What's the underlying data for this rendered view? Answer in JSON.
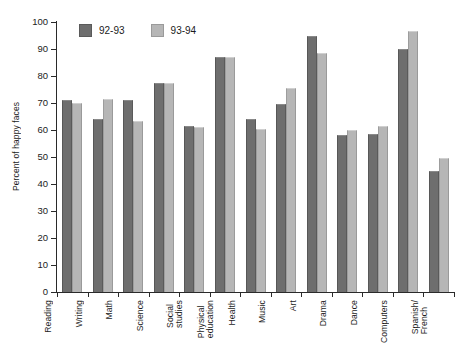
{
  "chart_data": {
    "type": "bar",
    "title": "",
    "xlabel": "",
    "ylabel": "Percent of happy faces",
    "ylim": [
      0,
      100
    ],
    "yticks": [
      0,
      10,
      20,
      30,
      40,
      50,
      60,
      70,
      80,
      90,
      100
    ],
    "grid": false,
    "legend_position": "top-left-inside",
    "categories": [
      "Reading",
      "Writing",
      "Math",
      "Science",
      "Social\nstudies",
      "Physical\neducation",
      "Health",
      "Music",
      "Art",
      "Drama",
      "Dance",
      "Computers",
      "Spanish/\nFrench"
    ],
    "series": [
      {
        "name": "92-93",
        "color": "#6e6e6e",
        "values": [
          71,
          64,
          71,
          77.5,
          61.5,
          87,
          64,
          69.5,
          95,
          58,
          58.5,
          90,
          45
        ]
      },
      {
        "name": "93-94",
        "color": "#b6b6b6",
        "values": [
          70,
          71.5,
          63.5,
          77.5,
          61,
          87,
          60.5,
          75.5,
          88.5,
          60,
          61.5,
          96.5,
          49.5
        ]
      }
    ]
  },
  "legend": {
    "entries": [
      {
        "label": "92-93"
      },
      {
        "label": "93-94"
      }
    ]
  },
  "colors": {
    "series_0": "#6e6e6e",
    "series_1": "#b6b6b6",
    "axis": "#2a2a2a",
    "background": "#ffffff"
  }
}
